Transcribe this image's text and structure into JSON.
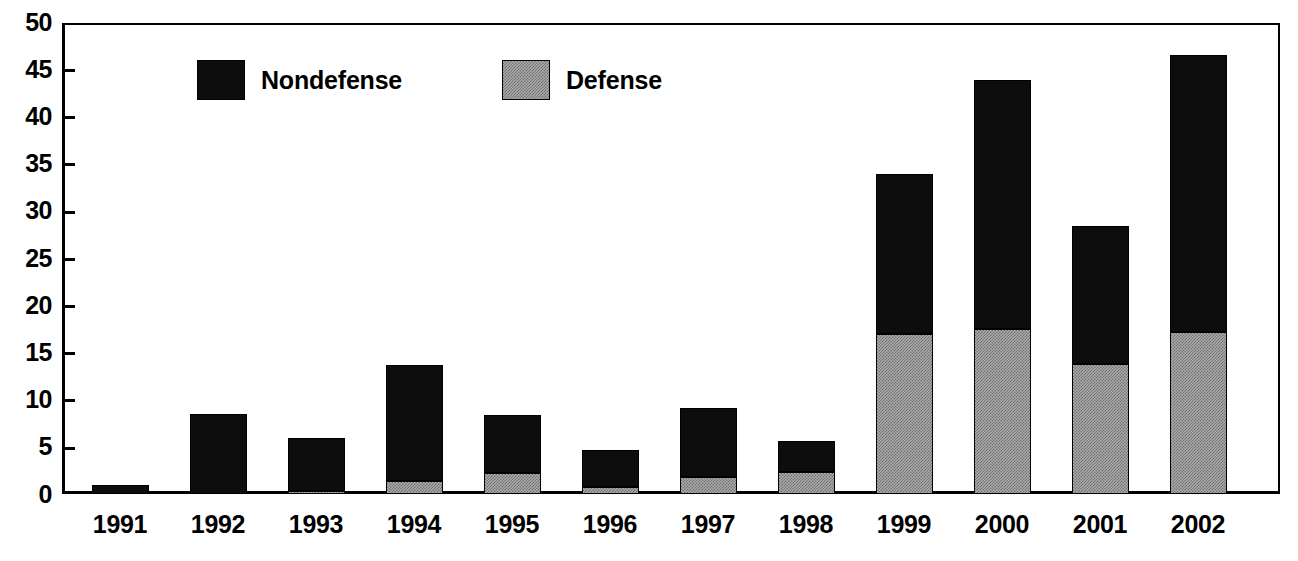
{
  "chart_data": {
    "type": "bar",
    "subtype": "stacked-vertical",
    "title": "",
    "subtitle": "",
    "xlabel": "",
    "ylabel": "",
    "categories": [
      "1991",
      "1992",
      "1993",
      "1994",
      "1995",
      "1996",
      "1997",
      "1998",
      "1999",
      "2000",
      "2001",
      "2002"
    ],
    "series": [
      {
        "name": "Defense",
        "color": "#ababab",
        "pattern": "stipple-gray",
        "values": [
          0.0,
          0.0,
          0.35,
          1.4,
          2.25,
          0.75,
          1.8,
          2.3,
          17.0,
          17.5,
          13.8,
          17.2
        ]
      },
      {
        "name": "Nondefense",
        "color": "#0d0d0d",
        "pattern": "solid-black",
        "values": [
          0.95,
          8.5,
          5.6,
          12.3,
          6.15,
          3.9,
          7.3,
          3.3,
          17.0,
          26.4,
          14.6,
          29.4
        ]
      }
    ],
    "totals": [
      0.95,
      8.5,
      5.95,
      13.7,
      8.4,
      4.65,
      9.1,
      5.6,
      34.0,
      43.9,
      28.4,
      46.6
    ],
    "ylim": [
      0,
      50
    ],
    "ytick_values": [
      0,
      5,
      10,
      15,
      20,
      25,
      30,
      35,
      40,
      45,
      50
    ],
    "ytick_labels": [
      "0",
      "5",
      "10",
      "15",
      "20",
      "25",
      "30",
      "35",
      "40",
      "45",
      "50"
    ],
    "grid": false,
    "legend_position": "top-left-inside",
    "stack_order_bottom_to_top": [
      "Defense",
      "Nondefense"
    ]
  },
  "legend": {
    "entries": [
      {
        "label": "Nondefense",
        "swatch": "black-square-swatch"
      },
      {
        "label": "Defense",
        "swatch": "gray-stipple-square-swatch"
      }
    ]
  },
  "axes": {
    "y": {
      "labels": [
        "50",
        "45",
        "40",
        "35",
        "30",
        "25",
        "20",
        "15",
        "10",
        "5",
        "0"
      ]
    },
    "x": {
      "labels": [
        "1991",
        "1992",
        "1993",
        "1994",
        "1995",
        "1996",
        "1997",
        "1998",
        "1999",
        "2000",
        "2001",
        "2002"
      ]
    }
  }
}
